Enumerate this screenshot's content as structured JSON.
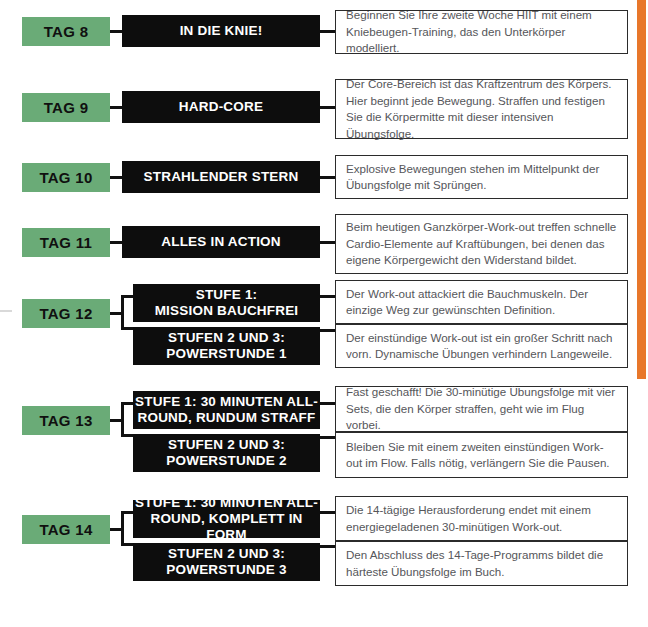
{
  "page": {
    "accent_color": "#e8772a",
    "tag_color": "#6aab77",
    "box_color": "#0d0d0d",
    "text_color": "#55565a"
  },
  "rows": [
    {
      "tag": "TAG 8",
      "entries": [
        {
          "title": "IN DIE KNIE!",
          "description": "Beginnen Sie Ihre zweite Woche HIIT mit einem Kniebeugen-Training, das den Unterkörper modelliert."
        }
      ]
    },
    {
      "tag": "TAG 9",
      "entries": [
        {
          "title": "HARD-CORE",
          "description": "Der Core-Bereich ist das Kraftzentrum des Körpers. Hier beginnt jede Bewegung. Straffen und festigen Sie die Körpermitte mit dieser intensiven Übungsfolge."
        }
      ]
    },
    {
      "tag": "TAG 10",
      "entries": [
        {
          "title": "STRAHLENDER STERN",
          "description": "Explosive Bewegungen stehen im Mittelpunkt der Übungsfolge mit Sprüngen."
        }
      ]
    },
    {
      "tag": "TAG 11",
      "entries": [
        {
          "title": "ALLES IN ACTION",
          "description": "Beim heutigen Ganzkörper-Work-out treffen schnelle Cardio-Elemente auf Kraftübungen, bei denen das eigene Körpergewicht den Widerstand bildet."
        }
      ]
    },
    {
      "tag": "TAG 12",
      "entries": [
        {
          "title": "STUFE 1:\nMISSION BAUCHFREI",
          "description": "Der Work-out attackiert die Bauchmuskeln. Der einzige Weg zur gewünschten Definition."
        },
        {
          "title": "STUFEN 2 UND 3:\nPOWERSTUNDE 1",
          "description": "Der einstündige Work-out ist ein großer Schritt nach vorn. Dynamische Übungen verhindern Langeweile."
        }
      ]
    },
    {
      "tag": "TAG 13",
      "entries": [
        {
          "title": "STUFE 1: 30 MINUTEN ALL-\nROUND, RUNDUM STRAFF",
          "description": "Fast geschafft! Die 30-minütige Übungsfolge mit vier Sets, die den Körper straffen, geht wie im Flug vorbei."
        },
        {
          "title": "STUFEN 2 UND 3:\nPOWERSTUNDE 2",
          "description": "Bleiben Sie mit einem zweiten einstündigen Work-out im Flow. Falls nötig, verlängern Sie die Pausen."
        }
      ]
    },
    {
      "tag": "TAG 14",
      "entries": [
        {
          "title": "STUFE 1: 30 MINUTEN ALL-\nROUND, KOMPLETT IN FORM",
          "description": "Die 14-tägige Herausforderung endet mit einem energiegeladenen 30-minütigen Work-out."
        },
        {
          "title": "STUFEN 2 UND 3:\nPOWERSTUNDE 3",
          "description": "Den Abschluss des 14-Tage-Programms bildet die härteste Übungsfolge im Buch."
        }
      ]
    }
  ]
}
